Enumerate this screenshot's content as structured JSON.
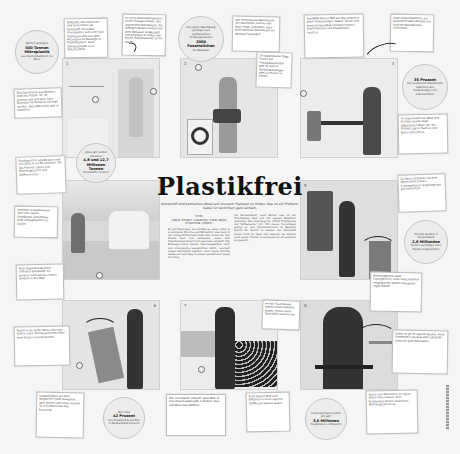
{
  "article": {
    "title": "Plastikfrei",
    "subtitle": "Kunststoff sind komischen Abrall auf unserem Planeten zu finden. Das ist ein Problem. Dabei ist Verzichten ganz einfach.",
    "byline_prefix": "VON",
    "byline_authors": "JANA OTERO (GRAFIK) UND ANJA FORSTER (TEXT)",
    "body_col1": "Es gibt Menschen, die schaffen es, keine Abfall zu produzieren. Bis ist es ein Extremfall, aber auch in der Alltags-Wirklichkeit kann man vieles tun. Viel Plastik lässt sich vermeiden, wenn man Gewohnheiten ändert und bewusster einkauft. Wer Einwegprodukte meidet, Mehrwegbehälter nutzt und unverpackte Lebensmittel wählt, reduziert seinen Plastikmüll deutlich. Auch kleine Schritte helfen auf dem Weg zu einem plastikfreien Leben im Alltag.",
    "body_col2": "Am Wochenmarkt, beim Bäcker oder an der Frischetheke lässt sich mit eigenen Behältern einkaufen. Wer unterwegs ist, nimmt Trinkflasche und Kaffeebecher mit. Mit diesen Vorschlägen gelingt es, den Plastikverbrauch im Haushalt Schritt für Schritt zu senken. Der Kunststoff landet nicht im Meer und belastet die Umwelt nicht weiter. Plastik zu vermeiden ist oft einfacher als gedacht."
  },
  "stats": [
    {
      "pre": "Jährlich gelangen",
      "value": "500 Tonnen Mikroplastik",
      "post": "aus Kosmetikartikeln ins Meer"
    },
    {
      "pre": "Bei jedem Waschgang gelangen aus synthetischen Kleidungsstücken",
      "value": "2000 Faserteilchen",
      "post": "ins Abwasser"
    },
    {
      "pre": "",
      "value": "35 Prozent",
      "post": "des weltweiten Plastikmülls stammen aus Verpackungen von Lebensmitteln"
    },
    {
      "pre": "Jedes Jahr landen zwischen",
      "value": "4,8 und 12,7 Millionen Tonnen",
      "post": "Kunststoffe im Meer"
    },
    {
      "pre": "Pro Jahr werden in Deutschland",
      "value": "2,8 Milliarden",
      "post": "Becher aus Pappe oder Plastik weggeworfen"
    },
    {
      "pre": "Nur etwa",
      "value": "42 Prozent",
      "post": "des Plastikmülls werden in Deutschland recycelt"
    },
    {
      "pre": "In Deutschland werden pro Jahr",
      "value": "3,6 Millionen",
      "post": "Plastiktüten verbraucht"
    }
  ],
  "panels": [
    {
      "number": "1",
      "scene": "Badezimmer"
    },
    {
      "number": "2",
      "scene": "Waschküche"
    },
    {
      "number": "3",
      "scene": "Küche"
    },
    {
      "number": "4",
      "scene": "Picknick"
    },
    {
      "number": "5",
      "scene": "Getränkeautomat"
    },
    {
      "number": "6",
      "scene": "Mülltonnen"
    },
    {
      "number": "7",
      "scene": "Supermarkt"
    },
    {
      "number": "8",
      "scene": "Café"
    }
  ],
  "notes": [
    {
      "text": "Duftstoffe oder Kosmetik sind nicht immer als Kunststoff erkennbar. Unverpackte Seife und feste Shampoos sind eine gute Alternative zu Duschgel in Plastikflaschen. Auch Zahnpasta gibt es in Tablettenform."
    },
    {
      "text": "In vielen Kosmetikprodukten steckt flüssiges Plastik, das sogenannte Mikroplastik. Die winzigen Partikel werden mit dem Abwasser weggespült und gelangen in Flüsse und Meere. Naturkosmetik ist frei davon."
    },
    {
      "text": "Eine Zahnbürste aus Bambus statt aus Plastik: Sie ist genauso gut und kann nach Gebrauch im Kompost entsorgt werden. Auch Zahnseide gibt es plastikfrei."
    },
    {
      "text": "Wer Kleidung aus Naturfasern wie Baumwolle, Leinen oder Wolle trägt, verhindert, dass beim Waschen Mikrofasern ins Abwasser gelangen."
    },
    {
      "text": "Ein Waschbeutel fängt Fasern auf. Flüssigwaschmittel gibt es auch in Nachfüllpackungen oder als Pulver im Karton."
    },
    {
      "text": "Gut 6000 Tonnen Müll am Tag entstehen durch Verpackungen. Gläser, Dosen und wiederverwendbare Behälter können Frischhaltefolie und Plastikboxen ersetzen."
    },
    {
      "text": "Statt Spülschwämmen aus Kunststoff lieber Bürsten aus Holz mit Naturborsten verwenden."
    },
    {
      "text": "Im Supermarkt lose Obst und Gemüse kaufen statt abgepackter Ware. Für den Einkauf eigene Taschen und Netze mitnehmen."
    },
    {
      "text": "Plastikgeschirr und Besteck sind seit 2021 in der EU verboten. Für das Picknick eignen sich Mehrweggeschirr und Stoffservietten."
    },
    {
      "text": "Getränke in Glasflaschen oder eine eigene Trinkflasche mitnehmen, statt Einwegflaschen zu kaufen."
    },
    {
      "text": "Auch Zigarettenstummel enthalten Kunststoff. Sie gehören nicht auf den Boden, sondern in den Müll."
    },
    {
      "text": "Zu Hause Getränke aus dem Wasserhahn trinken. Leitungswasser ist günstig und gut kontrolliert."
    },
    {
      "text": "Mehrwegbecher statt Einwegbecher: Viele Cafés befüllen mitgebrachte Becher und geben sogar Rabatt."
    },
    {
      "text": "Plastik in die Gelbe Tonne oder den Gelben Sack. Richtig getrennter Müll kann besser recycelt werden."
    },
    {
      "text": "Verpackungen vor dem Wegwerfen nicht ausspülen, aber Deckel und Folien trennen. So erleichtert man das Recycling."
    },
    {
      "text": "An der Frischetheke eigene Dosen befüllen lassen. Immer mehr Geschäfte machen mit."
    },
    {
      "text": "Wer unverpackt einkauft, spart Müll. In Unverpackt-Läden gibt es Nudeln, Reis und Müsli zum Abfüllen."
    },
    {
      "text": "Beim Bäcker Brot und Brötchen in einen eigenen Stoffbeutel packen lassen."
    },
    {
      "text": "Coffee to go im eigenen Becher. Auch Strohhalme aus Glas oder Edelstahl sind eine gute Alternative."
    },
    {
      "text": "Essen zum Mitnehmen in eigene Boxen füllen lassen. Viele Restaurants bieten inzwischen Mehrwegsysteme an."
    }
  ]
}
